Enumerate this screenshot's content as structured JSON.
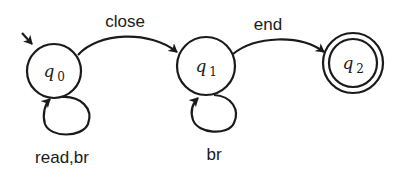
{
  "diagram": {
    "type": "finite-state-automaton",
    "colors": {
      "stroke": "#1a1a1a",
      "background": "#ffffff"
    },
    "states": [
      {
        "id": "q0",
        "base": "q",
        "sub": "0",
        "initial": true,
        "accepting": false
      },
      {
        "id": "q1",
        "base": "q",
        "sub": "1",
        "initial": false,
        "accepting": false
      },
      {
        "id": "q2",
        "base": "q",
        "sub": "2",
        "initial": false,
        "accepting": true
      }
    ],
    "transitions": [
      {
        "from": "q0",
        "to": "q1",
        "label": "close"
      },
      {
        "from": "q1",
        "to": "q2",
        "label": "end"
      },
      {
        "from": "q0",
        "to": "q0",
        "label": "read,br"
      },
      {
        "from": "q1",
        "to": "q1",
        "label": "br"
      }
    ]
  }
}
